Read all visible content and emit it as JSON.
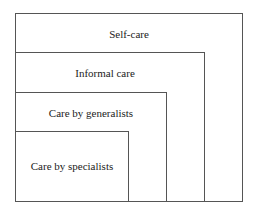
{
  "diagram": {
    "type": "nested-boxes",
    "layers": [
      {
        "label": "Self-care"
      },
      {
        "label": "Informal care"
      },
      {
        "label": "Care by generalists"
      },
      {
        "label": "Care by specialists"
      }
    ]
  }
}
